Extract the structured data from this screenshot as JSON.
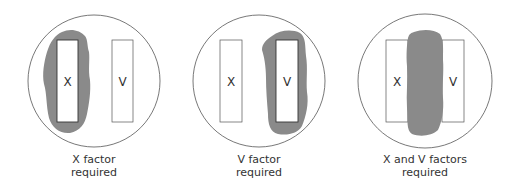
{
  "colors": {
    "growth": "#8a8a8a",
    "outline": "#555555",
    "text": "#333333"
  },
  "plates": [
    {
      "id": "x-factor",
      "strips": [
        {
          "label": "X"
        },
        {
          "label": "V"
        }
      ],
      "caption_line1": "X factor",
      "caption_line2": "required"
    },
    {
      "id": "v-factor",
      "strips": [
        {
          "label": "X"
        },
        {
          "label": "V"
        }
      ],
      "caption_line1": "V factor",
      "caption_line2": "required"
    },
    {
      "id": "x-and-v-factors",
      "strips": [
        {
          "label": "X"
        },
        {
          "label": "V"
        }
      ],
      "caption_line1": "X and V factors",
      "caption_line2": "required"
    }
  ]
}
